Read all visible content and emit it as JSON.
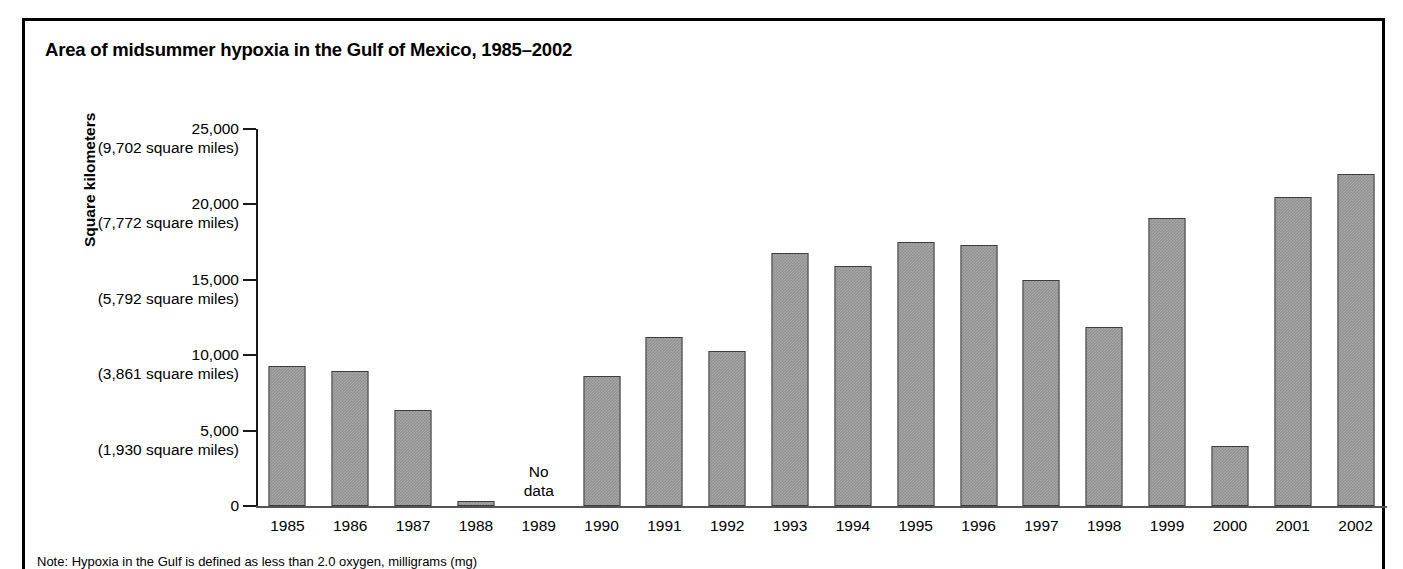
{
  "chart_data": {
    "type": "bar",
    "title": "Area of midsummer hypoxia in the Gulf of Mexico, 1985–2002",
    "xlabel": "",
    "ylabel": "Square kilometers",
    "ylim": [
      0,
      25000
    ],
    "grid": false,
    "legend": null,
    "categories": [
      "1985",
      "1986",
      "1987",
      "1988",
      "1989",
      "1990",
      "1991",
      "1992",
      "1993",
      "1994",
      "1995",
      "1996",
      "1997",
      "1998",
      "1999",
      "2000",
      "2001",
      "2002"
    ],
    "values": [
      9300,
      8950,
      6370,
      350,
      null,
      8600,
      11200,
      10300,
      16800,
      15900,
      17500,
      17300,
      15000,
      11850,
      19100,
      4000,
      20500,
      22000
    ],
    "annotations": [
      {
        "category": "1989",
        "line1": "No",
        "line2": "data"
      }
    ],
    "y_ticks": [
      {
        "value": 25000,
        "km": "25,000",
        "miles": "(9,702 square miles)"
      },
      {
        "value": 20000,
        "km": "20,000",
        "miles": "(7,772 square miles)"
      },
      {
        "value": 15000,
        "km": "15,000",
        "miles": "(5,792 square miles)"
      },
      {
        "value": 10000,
        "km": "10,000",
        "miles": "(3,861 square miles)"
      },
      {
        "value": 5000,
        "km": "5,000",
        "miles": "(1,930 square miles)"
      },
      {
        "value": 0,
        "km": "0",
        "miles": ""
      }
    ],
    "note": "Note: Hypoxia in the Gulf is defined as less than 2.0 oxygen, milligrams (mg)",
    "colors": {
      "bar_fill": "#a8a8a8",
      "bar_fill_dither": "#878787",
      "bar_border": "#3d3d3d",
      "axis": "#1a1a1a",
      "frame": "#000000",
      "text": "#000000"
    }
  }
}
